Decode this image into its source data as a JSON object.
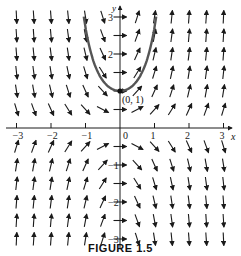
{
  "figure": {
    "caption": "FIGURE 1.5",
    "point_label": "(0, 1)",
    "x_axis_label": "x",
    "y_axis_label": "y",
    "x_ticks": [
      "-3",
      "-2",
      "-1",
      "0",
      "1",
      "2",
      "3"
    ],
    "y_ticks": [
      "3",
      "2",
      "-1",
      "-2",
      "-3"
    ],
    "x_range": [
      -3.3,
      3.3
    ],
    "y_range": [
      -3.2,
      3.2
    ],
    "field": "dy/dx = 2xy",
    "solution_curve": "y = e^(x^2)",
    "highlight_point": [
      0,
      1
    ],
    "colors": {
      "ink": "#1a1a1a",
      "curve": "#555555",
      "background": "#ffffff"
    }
  }
}
